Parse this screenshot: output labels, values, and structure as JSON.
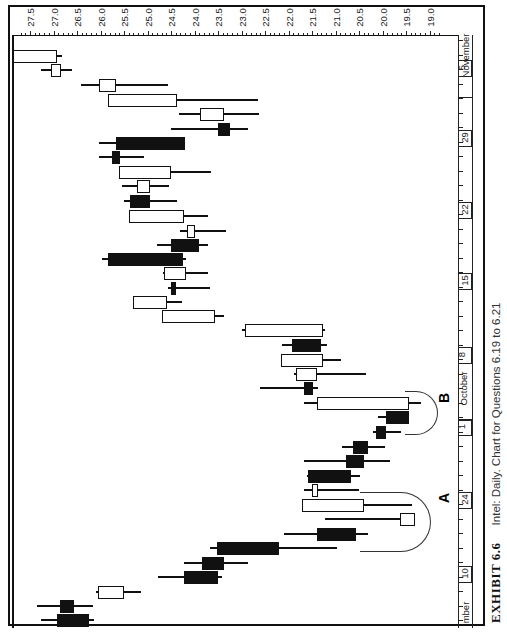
{
  "caption": {
    "exhibit": "EXHIBIT 6.6",
    "text": "Intel: Daily. Chart for Questions 6.19 to 6.21"
  },
  "annotations": [
    {
      "label": "A",
      "note": "circled candles near late September"
    },
    {
      "label": "B",
      "note": "circled candles near early October"
    }
  ],
  "chart_data": {
    "type": "candlestick",
    "title": "Intel: Daily. Chart for Questions 6.19 to 6.21",
    "orientation": "rotated 90° (price on horizontal axis, decreasing left→right; time on vertical axis, newest at top)",
    "price_axis": {
      "ticks": [
        "27.5",
        "27.0",
        "26.5",
        "26.0",
        "25.5",
        "25.0",
        "24.5",
        "24.0",
        "23.5",
        "23.0",
        "22.5",
        "22.0",
        "21.5",
        "21.0",
        "20.5",
        "20.0",
        "19.5",
        "19.0"
      ],
      "range": [
        19.0,
        27.5
      ]
    },
    "date_axis": {
      "week_labels": [
        "10",
        "24",
        "1",
        "8",
        "15",
        "22",
        "29",
        "5"
      ],
      "months": [
        "September",
        "October",
        "November"
      ],
      "month_visible_text": [
        "mber",
        "October",
        "November"
      ]
    },
    "candles": [
      {
        "y": 620,
        "open": 26.93,
        "high": 27.27,
        "low": 26.13,
        "close": 26.25,
        "color": "down"
      },
      {
        "y": 606,
        "open": 26.87,
        "high": 27.35,
        "low": 26.17,
        "close": 26.57,
        "color": "down"
      },
      {
        "y": 592,
        "open": 26.05,
        "high": 26.1,
        "low": 25.14,
        "close": 25.5,
        "color": "up"
      },
      {
        "y": 577,
        "open": 24.23,
        "high": 24.77,
        "low": 23.42,
        "close": 23.5,
        "color": "down"
      },
      {
        "y": 563,
        "open": 23.84,
        "high": 24.23,
        "low": 22.86,
        "close": 23.38,
        "color": "down"
      },
      {
        "y": 548,
        "open": 23.53,
        "high": 23.66,
        "low": 20.97,
        "close": 22.21,
        "color": "down"
      },
      {
        "y": 534,
        "open": 21.4,
        "high": 22.09,
        "low": 20.31,
        "close": 20.57,
        "color": "down"
      },
      {
        "y": 519,
        "open": 19.63,
        "high": 21.23,
        "low": 19.47,
        "close": 19.31,
        "color": "up"
      },
      {
        "y": 505,
        "open": 20.4,
        "high": 21.61,
        "low": 19.37,
        "close": 21.72,
        "color": "up"
      },
      {
        "y": 490,
        "open": 21.38,
        "high": 21.68,
        "low": 20.49,
        "close": 21.5,
        "color": "up"
      },
      {
        "y": 476,
        "open": 21.59,
        "high": 21.61,
        "low": 20.48,
        "close": 20.68,
        "color": "down"
      },
      {
        "y": 461,
        "open": 20.78,
        "high": 21.66,
        "low": 19.85,
        "close": 20.4,
        "color": "down"
      },
      {
        "y": 447,
        "open": 20.63,
        "high": 20.87,
        "low": 19.95,
        "close": 20.31,
        "color": "down"
      },
      {
        "y": 432,
        "open": 20.14,
        "high": 20.21,
        "low": 19.61,
        "close": 19.93,
        "color": "down"
      },
      {
        "y": 417,
        "open": 19.93,
        "high": 20.1,
        "low": 19.46,
        "close": 19.44,
        "color": "down"
      },
      {
        "y": 403,
        "open": 19.44,
        "high": 21.66,
        "low": 19.19,
        "close": 21.4,
        "color": "up"
      },
      {
        "y": 388,
        "open": 21.68,
        "high": 22.6,
        "low": 21.38,
        "close": 21.47,
        "color": "down"
      },
      {
        "y": 374,
        "open": 21.4,
        "high": 21.89,
        "low": 20.36,
        "close": 21.85,
        "color": "up"
      },
      {
        "y": 360,
        "open": 21.27,
        "high": 22.15,
        "low": 20.89,
        "close": 22.15,
        "color": "up"
      },
      {
        "y": 345,
        "open": 21.93,
        "high": 22.13,
        "low": 21.19,
        "close": 21.31,
        "color": "down"
      },
      {
        "y": 330,
        "open": 21.27,
        "high": 23.0,
        "low": 21.23,
        "close": 22.93,
        "color": "up"
      },
      {
        "y": 316,
        "open": 23.57,
        "high": 24.44,
        "low": 23.38,
        "close": 24.7,
        "color": "up"
      },
      {
        "y": 302,
        "open": 24.59,
        "high": 25.3,
        "low": 24.27,
        "close": 25.3,
        "color": "up"
      },
      {
        "y": 288,
        "open": 24.49,
        "high": 24.57,
        "low": 23.66,
        "close": 24.4,
        "color": "down"
      },
      {
        "y": 273,
        "open": 24.19,
        "high": 24.66,
        "low": 23.72,
        "close": 24.64,
        "color": "up"
      },
      {
        "y": 259,
        "open": 25.85,
        "high": 25.96,
        "low": 24.19,
        "close": 24.25,
        "color": "down"
      },
      {
        "y": 245,
        "open": 24.49,
        "high": 24.79,
        "low": 23.72,
        "close": 23.91,
        "color": "down"
      },
      {
        "y": 231,
        "open": 23.98,
        "high": 24.3,
        "low": 23.34,
        "close": 24.15,
        "color": "up"
      },
      {
        "y": 216,
        "open": 24.23,
        "high": 25.34,
        "low": 23.72,
        "close": 25.4,
        "color": "up"
      },
      {
        "y": 201,
        "open": 25.37,
        "high": 25.49,
        "low": 24.38,
        "close": 24.95,
        "color": "down"
      },
      {
        "y": 186,
        "open": 24.95,
        "high": 25.55,
        "low": 24.55,
        "close": 25.23,
        "color": "up"
      },
      {
        "y": 172,
        "open": 24.51,
        "high": 25.55,
        "low": 23.64,
        "close": 25.61,
        "color": "up"
      },
      {
        "y": 157,
        "open": 25.76,
        "high": 26.04,
        "low": 25.08,
        "close": 25.59,
        "color": "down"
      },
      {
        "y": 143,
        "open": 25.66,
        "high": 26.04,
        "low": 24.34,
        "close": 24.21,
        "color": "down"
      },
      {
        "y": 129,
        "open": 23.5,
        "high": 24.51,
        "low": 22.86,
        "close": 23.25,
        "color": "down"
      },
      {
        "y": 114,
        "open": 23.38,
        "high": 24.34,
        "low": 22.63,
        "close": 23.89,
        "color": "up"
      },
      {
        "y": 100,
        "open": 24.38,
        "high": 25.8,
        "low": 22.64,
        "close": 25.83,
        "color": "up"
      },
      {
        "y": 85,
        "open": 25.68,
        "high": 26.42,
        "low": 24.57,
        "close": 26.04,
        "color": "up"
      },
      {
        "y": 70,
        "open": 26.85,
        "high": 27.27,
        "low": 26.61,
        "close": 27.06,
        "color": "up"
      },
      {
        "y": 56,
        "open": 26.93,
        "high": 27.89,
        "low": 26.81,
        "close": 28.02,
        "color": "up"
      }
    ],
    "xlabel": "",
    "ylabel": "",
    "grid": false
  }
}
